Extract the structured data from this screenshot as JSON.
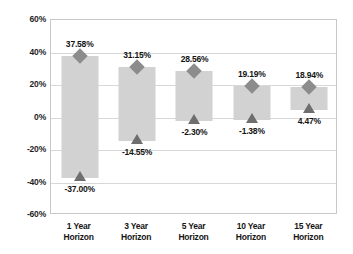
{
  "chart_data": {
    "type": "bar",
    "title": "",
    "subtitle": "",
    "xlabel": "",
    "ylabel": "",
    "ylim": [
      -60,
      60
    ],
    "ytick_step": 20,
    "grid": true,
    "legend": false,
    "legend_position": "none",
    "value_suffix": "%",
    "categories": [
      "1 Year Horizon",
      "3 Year Horizon",
      "5 Year Horizon",
      "10 Year Horizon",
      "15 Year Horizon"
    ],
    "category_lines": [
      [
        "1 Year",
        "Horizon"
      ],
      [
        "3 Year",
        "Horizon"
      ],
      [
        "5 Year",
        "Horizon"
      ],
      [
        "10 Year",
        "Horizon"
      ],
      [
        "15 Year",
        "Horizon"
      ]
    ],
    "ytick_labels": [
      "60%",
      "40%",
      "20%",
      "0%",
      "-20%",
      "-40%",
      "-60%"
    ],
    "ytick_values": [
      60,
      40,
      20,
      0,
      -20,
      -40,
      -60
    ],
    "series": [
      {
        "name": "Maximum Return",
        "marker": "diamond",
        "values": [
          37.58,
          31.15,
          28.56,
          19.19,
          18.94
        ],
        "labels": [
          "37.58%",
          "31.15%",
          "28.56%",
          "19.19%",
          "18.94%"
        ]
      },
      {
        "name": "Minimum Return",
        "marker": "triangle",
        "values": [
          -37.0,
          -14.55,
          -2.3,
          -1.38,
          4.47
        ],
        "labels": [
          "-37.00%",
          "-14.55%",
          "-2.30%",
          "-1.38%",
          "4.47%"
        ]
      }
    ],
    "bars": [
      {
        "category": "1 Year Horizon",
        "high": 37.58,
        "low": -37.0,
        "high_label": "37.58%",
        "low_label": "-37.00%"
      },
      {
        "category": "3 Year Horizon",
        "high": 31.15,
        "low": -14.55,
        "high_label": "31.15%",
        "low_label": "-14.55%"
      },
      {
        "category": "5 Year Horizon",
        "high": 28.56,
        "low": -2.3,
        "high_label": "28.56%",
        "low_label": "-2.30%"
      },
      {
        "category": "10 Year Horizon",
        "high": 19.19,
        "low": -1.38,
        "high_label": "19.19%",
        "low_label": "-1.38%"
      },
      {
        "category": "15 Year Horizon",
        "high": 18.94,
        "low": 4.47,
        "high_label": "18.94%",
        "low_label": "4.47%"
      }
    ],
    "colors": {
      "bar_fill": "#d2d2d2",
      "high_marker": "#8c8c8c",
      "low_marker": "#6e6e6e",
      "gridline": "#d8d8d8",
      "axis": "#c8c8c8",
      "text": "#1a1a1a",
      "background": "#ffffff"
    }
  }
}
